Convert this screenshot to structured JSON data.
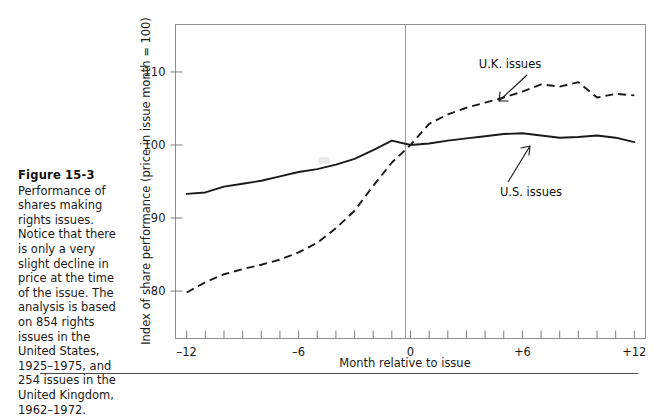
{
  "figure": {
    "number_label": "Figure 15-3",
    "caption": "Performance of\nshares making\nrights issues.\nNotice that there\nis only a very\nslight decline in\nprice at the time\nof the issue. The\nanalysis is based\non 854 rights\nissues in the\nUnited States,\n1925–1975, and\n254 issues in the\nUnited Kingdom,\n1962–1972."
  },
  "chart_data": {
    "type": "line",
    "title": "",
    "xlabel": "Month relative to issue",
    "ylabel": "Index of share performance (price in issue month = 100)",
    "xlim": [
      -12.6,
      12.6
    ],
    "ylim": [
      73.5,
      116.5
    ],
    "xticks": [
      -12,
      -11,
      -10,
      -9,
      -8,
      -7,
      -6,
      -5,
      -4,
      -3,
      -2,
      -1,
      0,
      1,
      2,
      3,
      4,
      5,
      6,
      7,
      8,
      9,
      10,
      11,
      12
    ],
    "xtick_labels": [
      {
        "value": -12,
        "label": "–12"
      },
      {
        "value": -6,
        "label": "–6"
      },
      {
        "value": 0,
        "label": "0"
      },
      {
        "value": 6,
        "label": "+6"
      },
      {
        "value": 12,
        "label": "+12"
      }
    ],
    "yticks": [
      80,
      90,
      100,
      110
    ],
    "ytick_labels": [
      "80",
      "90",
      "100",
      "110"
    ],
    "grid": false,
    "legend_position": "inline-annotations",
    "zero_reference_line": 0,
    "x": [
      -12,
      -11,
      -10,
      -9,
      -8,
      -7,
      -6,
      -5,
      -4,
      -3,
      -2,
      -1,
      0,
      1,
      2,
      3,
      4,
      5,
      6,
      7,
      8,
      9,
      10,
      11,
      12
    ],
    "series": [
      {
        "name": "U.S. issues",
        "style": "solid",
        "color": "#1a1a1a",
        "values": [
          93.3,
          93.5,
          94.3,
          94.7,
          95.1,
          95.7,
          96.3,
          96.7,
          97.3,
          98.1,
          99.3,
          100.6,
          100.0,
          100.2,
          100.6,
          100.9,
          101.2,
          101.5,
          101.6,
          101.3,
          101.0,
          101.1,
          101.3,
          101.0,
          100.4
        ]
      },
      {
        "name": "U.K. issues",
        "style": "dashed",
        "color": "#1a1a1a",
        "values": [
          79.8,
          81.2,
          82.3,
          83.0,
          83.6,
          84.3,
          85.3,
          86.6,
          88.6,
          91.0,
          94.4,
          97.6,
          100.0,
          102.9,
          104.2,
          105.1,
          105.8,
          106.5,
          107.3,
          108.3,
          108.0,
          108.6,
          106.5,
          107.0,
          106.8
        ]
      }
    ],
    "annotations": [
      {
        "text": "U.K. issues",
        "x": 8.7,
        "y": 113.6
      },
      {
        "text": "U.S. issues",
        "x": 8.6,
        "y": 97.6
      }
    ]
  }
}
